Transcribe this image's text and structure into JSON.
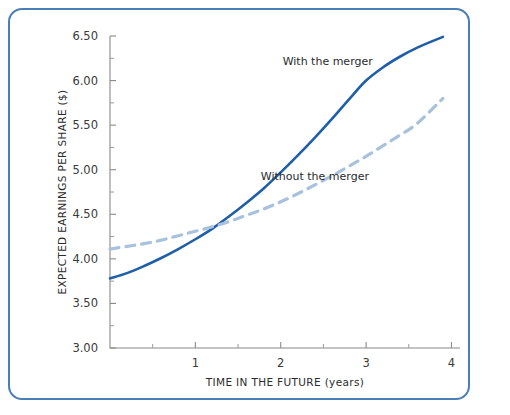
{
  "figure": {
    "border_color": "#4a7fb5",
    "background": "#ffffff"
  },
  "chart_data": {
    "type": "line",
    "title": "",
    "xlabel": "TIME IN THE FUTURE (years)",
    "ylabel": "EXPECTED EARNINGS PER SHARE ($)",
    "xlim": [
      0,
      4.1
    ],
    "ylim": [
      3.0,
      6.5
    ],
    "grid": false,
    "legend_position": "inline-annotations",
    "x_ticks": [
      1,
      2,
      3,
      4
    ],
    "x_tick_labels": [
      "1",
      "2",
      "3",
      "4"
    ],
    "x_minor_ticks": [
      0.5,
      1.5,
      2.5,
      3.5
    ],
    "y_ticks": [
      3.0,
      3.5,
      4.0,
      4.5,
      5.0,
      5.5,
      6.0,
      6.5
    ],
    "y_tick_labels": [
      "3.00",
      "3.50",
      "4.00",
      "4.50",
      "5.00",
      "5.50",
      "6.00",
      "6.50"
    ],
    "y_minor_ticks": [
      3.25,
      3.75,
      4.25,
      4.75,
      5.25,
      5.75,
      6.25
    ],
    "series": [
      {
        "name": "With the merger",
        "style": "solid",
        "color": "#1f5fa8",
        "annotation": "With the merger",
        "annotation_x": 2.55,
        "annotation_y": 6.18,
        "x": [
          0.0,
          0.2,
          0.4,
          0.6,
          0.8,
          1.0,
          1.2,
          1.4,
          1.6,
          1.8,
          2.0,
          2.2,
          2.4,
          2.6,
          2.8,
          3.0,
          3.2,
          3.4,
          3.6,
          3.9
        ],
        "y": [
          3.78,
          3.84,
          3.92,
          4.01,
          4.11,
          4.22,
          4.34,
          4.48,
          4.63,
          4.79,
          4.97,
          5.16,
          5.36,
          5.57,
          5.79,
          6.0,
          6.15,
          6.27,
          6.37,
          6.49
        ]
      },
      {
        "name": "Without the merger",
        "style": "dashed",
        "color": "#a8c2dd",
        "annotation": "Without the merger",
        "annotation_x": 2.4,
        "annotation_y": 4.88,
        "x": [
          0.0,
          0.2,
          0.4,
          0.6,
          0.8,
          1.0,
          1.2,
          1.4,
          1.6,
          1.8,
          2.0,
          2.2,
          2.4,
          2.6,
          2.8,
          3.0,
          3.2,
          3.4,
          3.6,
          3.9
        ],
        "y": [
          4.11,
          4.14,
          4.17,
          4.21,
          4.26,
          4.31,
          4.36,
          4.42,
          4.49,
          4.56,
          4.64,
          4.73,
          4.83,
          4.93,
          5.04,
          5.15,
          5.27,
          5.39,
          5.52,
          5.8
        ]
      }
    ],
    "crossing_point": {
      "x": 1.55,
      "y": 4.4
    }
  }
}
